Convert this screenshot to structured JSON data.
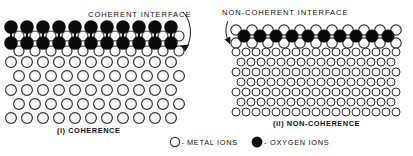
{
  "figure": {
    "width": 413,
    "height": 156,
    "background": "#ffffff",
    "ink_color": "#111111",
    "metal_fill": "#ffffff",
    "oxygen_fill": "#0a0a0a"
  },
  "panels": [
    {
      "id": "coherence",
      "annotation": "COHERENT  INTERFACE",
      "caption": "(i) COHERENCE",
      "oxide_rows": 2,
      "oxide_columns": 11,
      "substrate_rows": 5,
      "substrate_columns": 11,
      "interface_type": "coherent"
    },
    {
      "id": "non-coherence",
      "annotation": "NON-COHERENT   INTERFACE",
      "caption": "(ii) NON-COHERENCE",
      "oxide_rows": 1,
      "oxide_columns": 10,
      "substrate_rows": 7,
      "substrate_columns": 17,
      "interface_type": "non-coherent"
    }
  ],
  "legend": {
    "items": [
      {
        "symbol": "open-circle",
        "dash": "-",
        "label": "METAL  IONS"
      },
      {
        "symbol": "filled-circle",
        "dash": "-",
        "label": "OXYGEN  IONS"
      }
    ]
  }
}
